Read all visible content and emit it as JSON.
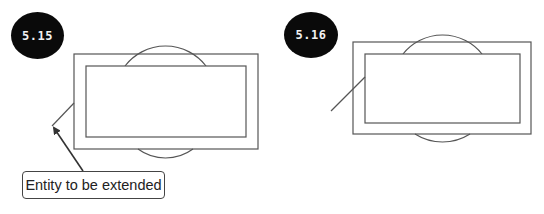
{
  "figures": [
    {
      "id": "5.15",
      "badge": {
        "label": "5.15",
        "x": 11,
        "y": 12,
        "w": 53,
        "h": 47
      },
      "outer_rect": {
        "x": 74,
        "y": 54,
        "w": 184,
        "h": 95
      },
      "inner_rect": {
        "x": 86,
        "y": 66,
        "w": 160,
        "h": 71
      },
      "top_arc": {
        "x1": 125,
        "x2": 206,
        "y": 66,
        "apex": 46
      },
      "bottom_arc": {
        "x1": 138,
        "x2": 193,
        "y": 149,
        "apex": 158
      },
      "line": {
        "x1": 52,
        "y1": 126,
        "x2": 74,
        "y2": 103
      },
      "callout": {
        "label": "Entity to be extended",
        "x": 22,
        "y": 171,
        "w": 143,
        "h": 28
      },
      "arrow": {
        "x1": 83,
        "y1": 171,
        "x2": 54,
        "y2": 128
      }
    },
    {
      "id": "5.16",
      "badge": {
        "label": "5.16",
        "x": 284,
        "y": 12,
        "w": 54,
        "h": 46
      },
      "outer_rect": {
        "x": 353,
        "y": 42,
        "w": 178,
        "h": 92
      },
      "inner_rect": {
        "x": 365,
        "y": 54,
        "w": 155,
        "h": 69
      },
      "top_arc": {
        "x1": 403,
        "x2": 482,
        "y": 54,
        "apex": 35
      },
      "bottom_arc": {
        "x1": 415,
        "x2": 470,
        "y": 134,
        "apex": 142
      },
      "line": {
        "x1": 331,
        "y1": 111,
        "x2": 365,
        "y2": 77
      }
    }
  ],
  "colors": {
    "stroke": "#555555",
    "badge_fill": "#0a0a0a",
    "badge_text": "#f2f2f2",
    "arrow": "#333333"
  }
}
